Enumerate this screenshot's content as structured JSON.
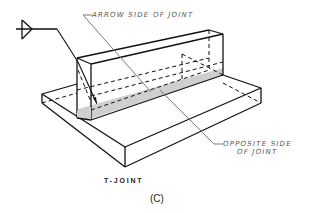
{
  "diagram": {
    "title": "T-JOINT",
    "figure_label": "(C)",
    "callouts": {
      "arrow_side": "ARROW SIDE OF JOINT",
      "opposite_side_line1": "OPPOSITE SIDE",
      "opposite_side_line2": "OF JOINT"
    },
    "symbols": {
      "weld_symbol": "fillet-weld-reference-line-icon"
    },
    "colors": {
      "line": "#111111",
      "leader": "#7a7a7a",
      "weld_fill": "#cfcfcf",
      "text": "#555555"
    }
  }
}
